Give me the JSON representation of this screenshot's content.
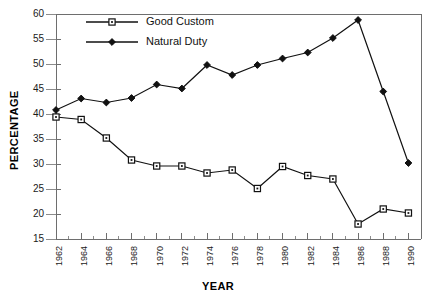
{
  "chart_data": {
    "type": "line",
    "title": "",
    "xlabel": "YEAR",
    "ylabel": "PERCENTAGE",
    "xlim": [
      1962,
      1991
    ],
    "ylim": [
      15,
      60
    ],
    "ytick_step": 5,
    "xtick_step": 2,
    "x_minor_step": 1,
    "grid": false,
    "legend_position": "top-left-inside",
    "yticks": [
      15,
      20,
      25,
      30,
      35,
      40,
      45,
      50,
      55,
      60
    ],
    "xticks": [
      1962,
      1964,
      1966,
      1968,
      1970,
      1972,
      1974,
      1976,
      1978,
      1980,
      1982,
      1984,
      1986,
      1988,
      1990
    ],
    "x": [
      1962,
      1964,
      1966,
      1968,
      1970,
      1972,
      1974,
      1976,
      1978,
      1980,
      1982,
      1984,
      1986,
      1988,
      1990
    ],
    "series": [
      {
        "name": "Good Custom",
        "marker": "open-square",
        "color": "#111111",
        "values": [
          39.4,
          38.9,
          35.2,
          30.8,
          29.6,
          29.6,
          28.2,
          28.8,
          25.1,
          29.5,
          27.7,
          27.0,
          18.0,
          21.0,
          20.2
        ]
      },
      {
        "name": "Natural Duty",
        "marker": "filled-diamond",
        "color": "#111111",
        "values": [
          40.8,
          43.1,
          42.3,
          43.2,
          45.9,
          45.1,
          49.8,
          47.8,
          49.8,
          51.1,
          52.3,
          55.2,
          58.8,
          44.5,
          30.2
        ]
      }
    ]
  },
  "legend": {
    "entries": [
      {
        "label": "Good Custom"
      },
      {
        "label": "Natural Duty"
      }
    ]
  },
  "axes": {
    "x_title": "YEAR",
    "y_title": "PERCENTAGE"
  }
}
